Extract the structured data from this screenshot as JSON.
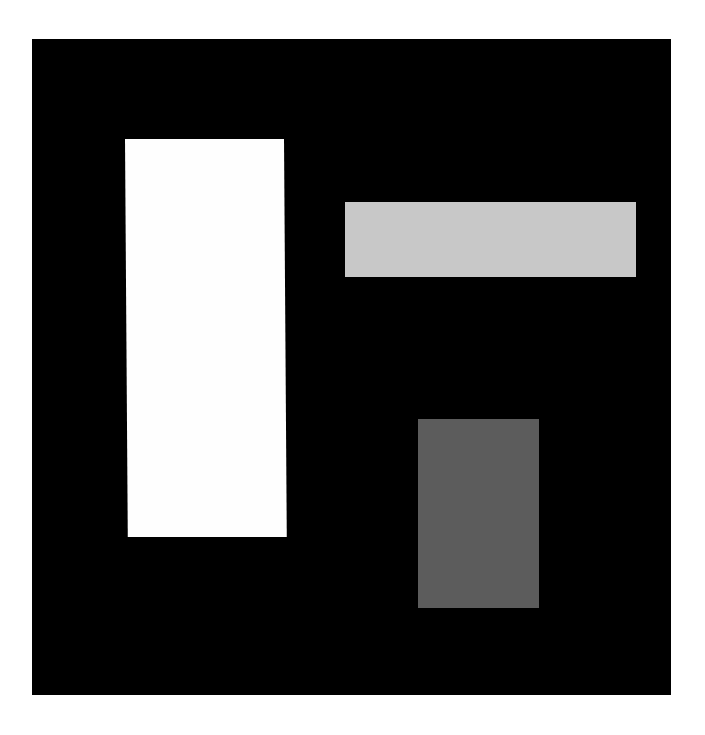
{
  "canvas": {
    "width": 705,
    "height": 735,
    "background": "#ffffff"
  },
  "panel": {
    "color": "#000000",
    "x": 32,
    "y": 39,
    "width": 639,
    "height": 656
  },
  "shapes": [
    {
      "name": "tall-white-rectangle",
      "color": "#fefefe",
      "x": 125,
      "y": 139,
      "width": 159,
      "height": 398
    },
    {
      "name": "wide-light-gray-rectangle",
      "color": "#c8c8c8",
      "x": 345,
      "y": 202,
      "width": 291,
      "height": 75
    },
    {
      "name": "dark-gray-rectangle",
      "color": "#5c5c5c",
      "x": 418,
      "y": 419,
      "width": 121,
      "height": 189
    }
  ]
}
